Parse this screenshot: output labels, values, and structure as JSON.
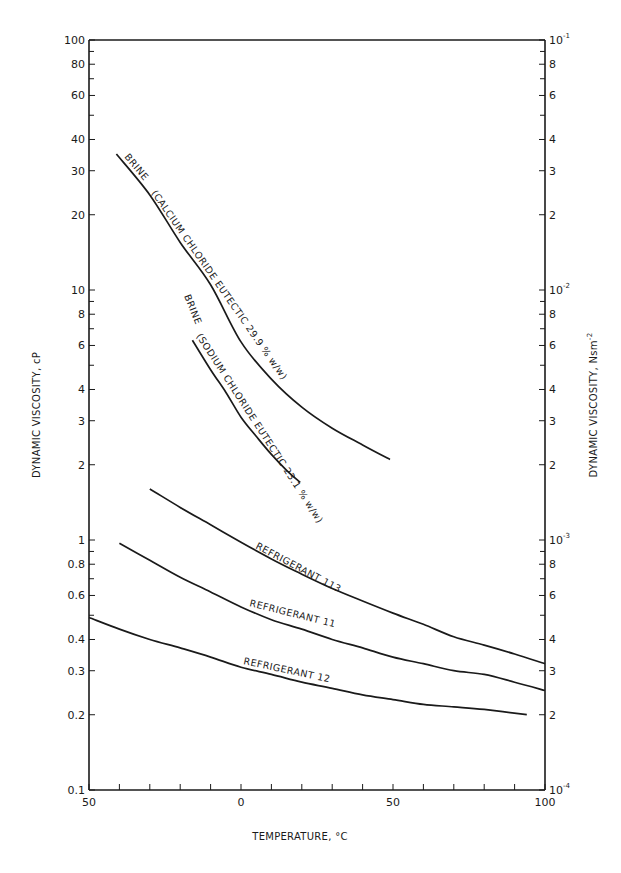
{
  "chart_data": {
    "type": "line",
    "title": "",
    "xlabel": "TEMPERATURE, °C",
    "ylabel_left": "DYNAMIC VISCOSITY, cP",
    "ylabel_right": "DYNAMIC VISCOSITY, Nsm⁻²",
    "xlim": [
      -50,
      100
    ],
    "ylim": [
      0.1,
      100
    ],
    "yscale": "log",
    "grid": false,
    "legend": "inline labels on curves",
    "x_ticks": [
      -50,
      -40,
      -30,
      -20,
      -10,
      0,
      10,
      20,
      30,
      40,
      50,
      60,
      70,
      80,
      90,
      100
    ],
    "x_tick_labels": [
      {
        "value": -50,
        "label": "50"
      },
      {
        "value": 0,
        "label": "0"
      },
      {
        "value": 50,
        "label": "50"
      },
      {
        "value": 100,
        "label": "100"
      }
    ],
    "y_left_tick_labels": [
      {
        "value": 100,
        "label": "100"
      },
      {
        "value": 80,
        "label": "80"
      },
      {
        "value": 60,
        "label": "60"
      },
      {
        "value": 40,
        "label": "40"
      },
      {
        "value": 30,
        "label": "30"
      },
      {
        "value": 20,
        "label": "20"
      },
      {
        "value": 10,
        "label": "10"
      },
      {
        "value": 8,
        "label": "8"
      },
      {
        "value": 6,
        "label": "6"
      },
      {
        "value": 4,
        "label": "4"
      },
      {
        "value": 3,
        "label": "3"
      },
      {
        "value": 2,
        "label": "2"
      },
      {
        "value": 1,
        "label": "1"
      },
      {
        "value": 0.8,
        "label": "0.8"
      },
      {
        "value": 0.6,
        "label": "0.6"
      },
      {
        "value": 0.4,
        "label": "0.4"
      },
      {
        "value": 0.3,
        "label": "0.3"
      },
      {
        "value": 0.2,
        "label": "0.2"
      },
      {
        "value": 0.1,
        "label": "0.1"
      }
    ],
    "y_left_minor_ticks": [
      90,
      70,
      50,
      9,
      7,
      5,
      0.9,
      0.7,
      0.5
    ],
    "y_right_tick_labels": [
      {
        "value": 100,
        "label": "10",
        "exp": "-1"
      },
      {
        "value": 80,
        "label": "8"
      },
      {
        "value": 60,
        "label": "6"
      },
      {
        "value": 40,
        "label": "4"
      },
      {
        "value": 30,
        "label": "3"
      },
      {
        "value": 20,
        "label": "2"
      },
      {
        "value": 10,
        "label": "10",
        "exp": "-2"
      },
      {
        "value": 8,
        "label": "8"
      },
      {
        "value": 6,
        "label": "6"
      },
      {
        "value": 4,
        "label": "4"
      },
      {
        "value": 3,
        "label": "3"
      },
      {
        "value": 2,
        "label": "2"
      },
      {
        "value": 1,
        "label": "10",
        "exp": "-3"
      },
      {
        "value": 0.8,
        "label": "8"
      },
      {
        "value": 0.6,
        "label": "6"
      },
      {
        "value": 0.4,
        "label": "4"
      },
      {
        "value": 0.3,
        "label": "3"
      },
      {
        "value": 0.2,
        "label": "2"
      },
      {
        "value": 0.1,
        "label": "10",
        "exp": "-4"
      }
    ],
    "series": [
      {
        "name": "BRINE (CALCIUM CHLORIDE EUTECTIC 29.9 % w/w)",
        "label_lines": [
          "BRINE",
          "(CALCIUM",
          "CHLORIDE",
          "EUTECTIC",
          "29.9 %",
          "w/w)"
        ],
        "x": [
          -41,
          -30,
          -20,
          -10,
          0,
          10,
          20,
          30,
          40,
          49
        ],
        "y": [
          35,
          24,
          15.5,
          10.5,
          6.2,
          4.4,
          3.4,
          2.8,
          2.4,
          2.1
        ]
      },
      {
        "name": "BRINE (SODIUM CHLORIDE EUTECTIC 23.1 % w/w)",
        "label_lines": [
          "BRINE",
          "(SODIUM",
          "CHLORIDE",
          "EUTECTIC",
          "23.1 %",
          "w/w)"
        ],
        "x": [
          -16,
          -10,
          -5,
          0,
          5,
          10,
          15,
          19.5
        ],
        "y": [
          6.3,
          4.8,
          3.9,
          3.1,
          2.6,
          2.2,
          1.9,
          1.7
        ]
      },
      {
        "name": "REFRIGERANT 113",
        "x": [
          -30,
          -20,
          -10,
          0,
          10,
          20,
          30,
          40,
          50,
          60,
          70,
          80,
          90,
          100
        ],
        "y": [
          1.6,
          1.35,
          1.15,
          0.98,
          0.84,
          0.73,
          0.64,
          0.57,
          0.51,
          0.46,
          0.41,
          0.38,
          0.35,
          0.32
        ]
      },
      {
        "name": "REFRIGERANT 11",
        "x": [
          -40,
          -30,
          -20,
          -10,
          0,
          10,
          20,
          30,
          40,
          50,
          60,
          70,
          80,
          90,
          100
        ],
        "y": [
          0.97,
          0.83,
          0.71,
          0.62,
          0.54,
          0.48,
          0.44,
          0.4,
          0.37,
          0.34,
          0.32,
          0.3,
          0.29,
          0.27,
          0.25
        ]
      },
      {
        "name": "REFRIGERANT 12",
        "x": [
          -50,
          -40,
          -30,
          -20,
          -10,
          0,
          10,
          20,
          30,
          40,
          50,
          60,
          70,
          80,
          94
        ],
        "y": [
          0.49,
          0.44,
          0.4,
          0.37,
          0.34,
          0.31,
          0.29,
          0.27,
          0.255,
          0.24,
          0.23,
          0.22,
          0.215,
          0.21,
          0.2
        ]
      }
    ]
  },
  "labels": {
    "xlabel": "TEMPERATURE, °C",
    "ylabel_left": "DYNAMIC VISCOSITY,  cP",
    "ylabel_right": "DYNAMIC VISCOSITY,  Nsm",
    "ylabel_right_exp": "-2",
    "r113": "REFRIGERANT   113",
    "r11": "REFRIGERANT   11",
    "r12": "REFRIGERANT   12",
    "cacl_1": "BRINE",
    "cacl_2": "(CALCIUM  CHLORIDE  EUTECTIC  29.9 %  w/w)",
    "nacl_1": "BRINE",
    "nacl_2": "(SODIUM  CHLORIDE  EUTECTIC  23.1 %  w/w)"
  }
}
